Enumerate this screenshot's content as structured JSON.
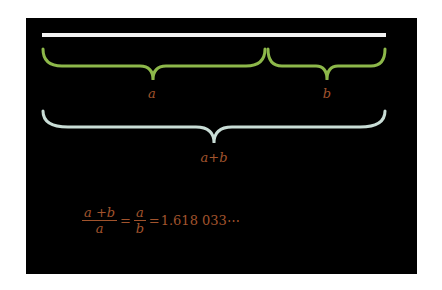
{
  "colors": {
    "background": "#000000",
    "segment": "#f2f2f2",
    "brace_parts": "#8db84a",
    "brace_total": "#c9ddd6",
    "label": "#a2542d"
  },
  "diagram": {
    "segment": {
      "x1": 42,
      "x2": 386,
      "y": 35
    },
    "braces": [
      {
        "id": "a",
        "label": "a",
        "x1": 42,
        "x2": 265,
        "y": 48,
        "label_x": 152,
        "label_y": 87
      },
      {
        "id": "b",
        "label": "b",
        "x1": 267,
        "x2": 386,
        "y": 48,
        "label_x": 327,
        "label_y": 87
      },
      {
        "id": "a_plus_b",
        "label": "a+b",
        "x1": 42,
        "x2": 386,
        "y": 110,
        "label_x": 214,
        "label_y": 152
      }
    ]
  },
  "formula": {
    "frac1": {
      "numerator": "a +b",
      "denominator": "a"
    },
    "eq1": "=",
    "frac2": {
      "numerator": "a",
      "denominator": "b"
    },
    "eq2": "=",
    "value": "1.618 033⋯"
  }
}
